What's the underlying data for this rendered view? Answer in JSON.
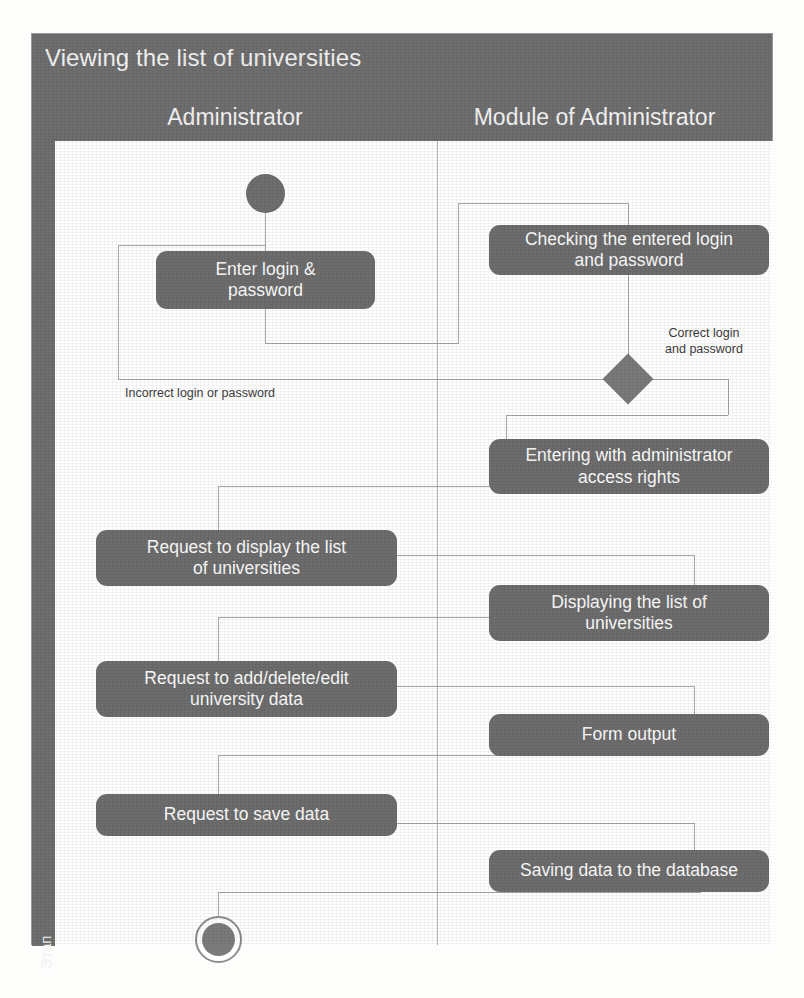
{
  "diagram": {
    "title": "Viewing the list of universities",
    "stage_label": "Этап",
    "lanes": [
      {
        "id": "administrator",
        "header": "Administrator"
      },
      {
        "id": "module-of-administrator",
        "header": "Module of Administrator"
      }
    ],
    "nodes": [
      {
        "id": "start",
        "kind": "start",
        "lane": "administrator",
        "label": ""
      },
      {
        "id": "enter-login",
        "kind": "activity",
        "lane": "administrator",
        "label": "Enter login &\npassword"
      },
      {
        "id": "checking-login",
        "kind": "activity",
        "lane": "module-of-administrator",
        "label": "Checking the entered login\nand password"
      },
      {
        "id": "decision",
        "kind": "decision",
        "lane": "module-of-administrator",
        "label": ""
      },
      {
        "id": "entering-rights",
        "kind": "activity",
        "lane": "module-of-administrator",
        "label": "Entering with administrator\naccess rights"
      },
      {
        "id": "request-display",
        "kind": "activity",
        "lane": "administrator",
        "label": "Request to display the list\nof universities"
      },
      {
        "id": "displaying-list",
        "kind": "activity",
        "lane": "module-of-administrator",
        "label": "Displaying the list of\nuniversities"
      },
      {
        "id": "request-edit",
        "kind": "activity",
        "lane": "administrator",
        "label": "Request to add/delete/edit\nuniversity data"
      },
      {
        "id": "form-output",
        "kind": "activity",
        "lane": "module-of-administrator",
        "label": "Form output"
      },
      {
        "id": "request-save",
        "kind": "activity",
        "lane": "administrator",
        "label": "Request to save data"
      },
      {
        "id": "saving-db",
        "kind": "activity",
        "lane": "module-of-administrator",
        "label": "Saving data to the database"
      },
      {
        "id": "end",
        "kind": "end",
        "lane": "administrator",
        "label": ""
      }
    ],
    "edge_labels": [
      {
        "id": "correct-credentials",
        "text": "Correct login\nand password"
      },
      {
        "id": "incorrect-credentials",
        "text": "Incorrect login or password"
      }
    ],
    "colors": {
      "node_fill": "#6d6d6d",
      "band_fill": "#6f6f6f",
      "node_text": "#fbfbfb",
      "connector": "#a8a8a8",
      "canvas": "#ffffff",
      "frame_border": "#9a9a9a"
    }
  }
}
